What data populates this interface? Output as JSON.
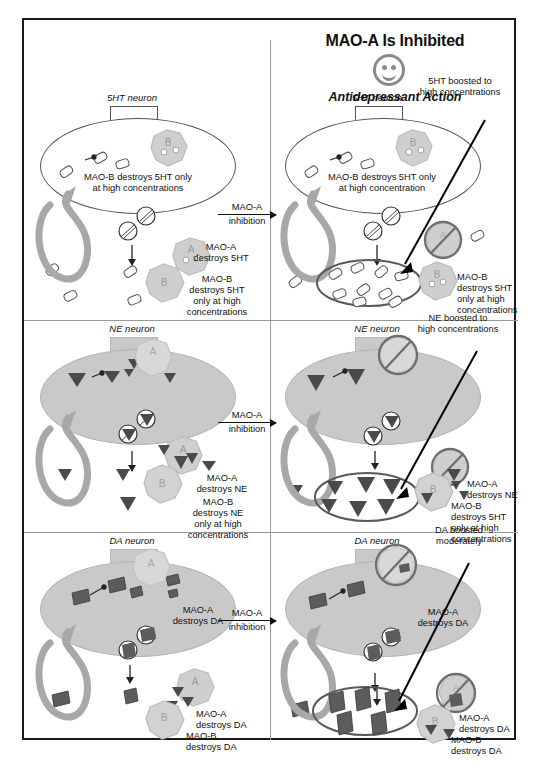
{
  "figure": {
    "title": "MAO-A Is Inhibited",
    "subtitle": "Antidepressant Action",
    "smiley_icon": "smiley-face-icon",
    "transition_label_top": "MAO-A",
    "transition_label_bottom": "inhibition"
  },
  "colors": {
    "frame": "#1a1a1a",
    "divider": "#999999",
    "neuron_fill": "#c9c9c9",
    "neuron_stroke": "#555555",
    "enzyme_fill": "#cfcfcf",
    "enzyme_stroke": "#b0b0b0",
    "recycle_arrow": "#a8a8a8",
    "highlight_ellipse": "#5a5a5a",
    "transmitter_dark": "#4a4a4a",
    "pointer_arrow": "#000000"
  },
  "rows": [
    {
      "id": "5ht",
      "neuron_label": "5HT neuron",
      "neuron_filled": false,
      "before": {
        "inside_text": "MAO-B destroys 5HT only\nat high concentrations",
        "inside_enzyme": "B",
        "labels": [
          {
            "name": "mao-a-destroys-5ht",
            "text": "MAO-A\ndestroys 5HT",
            "enzyme": "A"
          },
          {
            "name": "mao-b-destroys-5ht",
            "text": "MAO-B\ndestroys 5HT\nonly at high\nconcentrations",
            "enzyme": "B"
          }
        ]
      },
      "after": {
        "inside_text": "MAO-B destroys 5HT only\nat high concentration",
        "inside_enzyme": "B",
        "callout": "5HT boosted to\nhigh concentrations",
        "inhibited_enzyme": "A",
        "labels": [
          {
            "name": "mao-b-destroys-5ht",
            "text": "MAO-B\ndestroys 5HT\nonly at high\nconcentrations",
            "enzyme": "B"
          }
        ]
      }
    },
    {
      "id": "ne",
      "neuron_label": "NE neuron",
      "neuron_filled": true,
      "before": {
        "inside_text": "",
        "inside_enzyme": "A",
        "labels": [
          {
            "name": "mao-a-destroys-ne",
            "text": "MAO-A\ndestroys NE",
            "enzyme": "A"
          },
          {
            "name": "mao-b-destroys-ne",
            "text": "MAO-B\ndestroys NE\nonly at high\nconcentrations",
            "enzyme": "B"
          }
        ]
      },
      "after": {
        "inside_text": "",
        "inside_enzyme": "A",
        "callout": "NE boosted to\nhigh concentrations",
        "inhibited_enzyme": "A",
        "labels": [
          {
            "name": "mao-a-destroys-ne",
            "text": "MAO-A\ndestroys NE",
            "enzyme": "A"
          },
          {
            "name": "mao-b-destroys-5ht",
            "text": "MAO-B\ndestroys 5HT\nonly at high\nconcentrations",
            "enzyme": "B"
          }
        ]
      }
    },
    {
      "id": "da",
      "neuron_label": "DA neuron",
      "neuron_filled": true,
      "before": {
        "inside_text": "MAO-A\ndestroys DA",
        "inside_enzyme": "A",
        "labels": [
          {
            "name": "mao-a-destroys-da",
            "text": "MAO-A\ndestroys DA",
            "enzyme": "A"
          },
          {
            "name": "mao-b-destroys-da",
            "text": "MAO-B\ndestroys DA",
            "enzyme": "B"
          }
        ]
      },
      "after": {
        "inside_text": "MAO-A\ndestroys DA",
        "inside_enzyme": "A",
        "callout": "DA boosted\nmoderately",
        "inhibited_enzyme": "A",
        "labels": [
          {
            "name": "mao-a-destroys-da",
            "text": "MAO-A\ndestroys DA",
            "enzyme": "A"
          },
          {
            "name": "mao-b-destroys-da",
            "text": "MAO-B\ndestroys DA",
            "enzyme": "B"
          }
        ]
      }
    }
  ]
}
